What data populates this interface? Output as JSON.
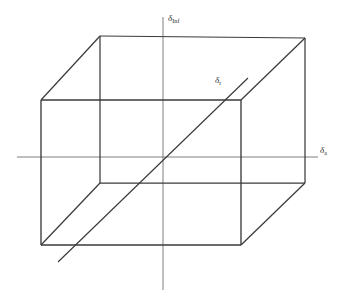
{
  "figure": {
    "width": 342,
    "height": 301,
    "background_color": "#ffffff",
    "line_color": "#3a3a3a",
    "axis_color": "#6f6f6f",
    "text_color": "#2b2b2b"
  },
  "labels": {
    "vertical_axis": {
      "symbol": "δ",
      "subscript": "Inf",
      "full": "δInf"
    },
    "horizontal_axis": {
      "symbol": "δ",
      "subscript": "a",
      "full": "δa"
    },
    "diagonal": {
      "symbol": "δ",
      "subscript": "r",
      "full": "δr"
    }
  },
  "geometry": {
    "front_face": {
      "top_left": [
        41,
        100
      ],
      "top_right": [
        241,
        100
      ],
      "bottom_right": [
        241,
        245
      ],
      "bottom_left": [
        41,
        245
      ]
    },
    "back_face": {
      "top_left": [
        100,
        36
      ],
      "top_right": [
        305,
        38
      ],
      "bottom_right": [
        305,
        183
      ],
      "bottom_left": [
        100,
        122
      ]
    },
    "vertical_axis": {
      "x": 163,
      "y_top": 17,
      "y_bottom": 290
    },
    "horizontal_axis": {
      "y": 157,
      "x_left": 17,
      "x_right": 318
    },
    "diagonal": {
      "start": [
        58,
        262
      ],
      "end": [
        248,
        78
      ]
    }
  }
}
